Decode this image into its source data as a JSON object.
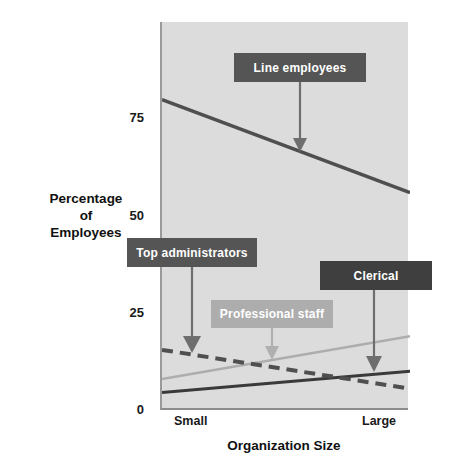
{
  "chart_data": {
    "type": "line",
    "title": "",
    "subtitle": "",
    "xlabel": "Organization Size",
    "ylabel": "Percentage of Employees",
    "ylabel_lines": [
      "Percentage",
      "of",
      "Employees"
    ],
    "x": [
      "Small",
      "Large"
    ],
    "xtick_labels": [
      "Small",
      "Large"
    ],
    "ytick_labels": [
      "0",
      "25",
      "50",
      "75"
    ],
    "ytick_values": [
      0,
      25,
      50,
      75
    ],
    "ylim": [
      0,
      100
    ],
    "grid": false,
    "legend": "inline-callout-labels",
    "plot_background": "#dcdcdc",
    "series": [
      {
        "name": "Line employees",
        "values": [
          80,
          56
        ],
        "style": "solid",
        "color": "#4f4f4f",
        "width": 3.5
      },
      {
        "name": "Top administrators",
        "values": [
          15.5,
          5.5
        ],
        "style": "dashed",
        "color": "#4f4f4f",
        "width": 4
      },
      {
        "name": "Professional staff",
        "values": [
          8,
          19
        ],
        "style": "solid",
        "color": "#adadad",
        "width": 2.5
      },
      {
        "name": "Clerical",
        "values": [
          4.5,
          10
        ],
        "style": "solid",
        "color": "#3a3a3a",
        "width": 3
      }
    ],
    "annotations": [
      {
        "label": "Line employees",
        "box_color": "#555555",
        "text_color": "#ffffff",
        "points_to": "Line employees"
      },
      {
        "label": "Top administrators",
        "box_color": "#555555",
        "text_color": "#ffffff",
        "points_to": "Top administrators"
      },
      {
        "label": "Professional staff",
        "box_color": "#adadad",
        "text_color": "#ffffff",
        "points_to": "Professional staff"
      },
      {
        "label": "Clerical",
        "box_color": "#3f3f3f",
        "text_color": "#ffffff",
        "points_to": "Clerical"
      }
    ]
  },
  "axes": {
    "y_ticks": [
      {
        "label": "75",
        "value": 75
      },
      {
        "label": "50",
        "value": 50
      },
      {
        "label": "25",
        "value": 25
      },
      {
        "label": "0",
        "value": 0
      }
    ],
    "x_ticks": [
      {
        "label": "Small"
      },
      {
        "label": "Large"
      }
    ],
    "y_title_lines": [
      "Percentage",
      "of",
      "Employees"
    ],
    "x_title": "Organization Size"
  },
  "callouts": {
    "line_employees": "Line employees",
    "top_administrators": "Top administrators",
    "professional_staff": "Professional staff",
    "clerical": "Clerical"
  }
}
